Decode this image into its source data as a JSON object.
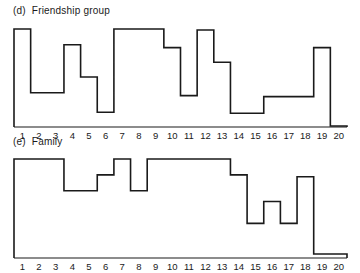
{
  "chart_data": [
    {
      "type": "line",
      "subtype": "step",
      "panel": "(d)",
      "title": "Friendship group",
      "xlabel": "",
      "ylabel": "",
      "categories": [
        "1",
        "2",
        "3",
        "4",
        "5",
        "6",
        "7",
        "8",
        "9",
        "10",
        "11",
        "12",
        "13",
        "14",
        "15",
        "16",
        "17",
        "18",
        "19",
        "20"
      ],
      "values": [
        1.0,
        0.35,
        0.35,
        0.84,
        0.51,
        0.15,
        1.0,
        1.0,
        1.0,
        0.81,
        0.32,
        0.99,
        0.66,
        0.14,
        0.14,
        0.31,
        0.31,
        0.31,
        0.81,
        0.01
      ],
      "ylim": [
        0,
        1
      ],
      "grid": false,
      "legend": null,
      "note": "Relative step heights; no y-axis scale shown"
    },
    {
      "type": "line",
      "subtype": "step",
      "panel": "(e)",
      "title": "Family",
      "xlabel": "",
      "ylabel": "",
      "categories": [
        "1",
        "2",
        "3",
        "4",
        "5",
        "6",
        "7",
        "8",
        "9",
        "10",
        "11",
        "12",
        "13",
        "14",
        "15",
        "16",
        "17",
        "18",
        "19",
        "20"
      ],
      "values": [
        1.0,
        1.0,
        1.0,
        0.68,
        0.68,
        0.84,
        1.0,
        0.68,
        1.0,
        1.0,
        1.0,
        1.0,
        1.0,
        0.84,
        0.35,
        0.57,
        0.35,
        0.82,
        0.04,
        0.04
      ],
      "ylim": [
        0,
        1
      ],
      "grid": false,
      "legend": null,
      "note": "Relative step heights; no y-axis scale shown"
    }
  ],
  "panels": {
    "d": {
      "tag": "(d)",
      "title": "Friendship group"
    },
    "e": {
      "tag": "(e)",
      "title": "Family"
    }
  },
  "style": {
    "line_color": "#1a1a1a",
    "background": "#ffffff"
  }
}
